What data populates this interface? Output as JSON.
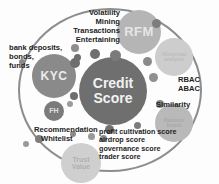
{
  "diagram": {
    "center_node": {
      "label_line1": "Credit",
      "label_line2": "Score"
    },
    "nodes": [
      {
        "id": "rfm",
        "label": "RFM"
      },
      {
        "id": "kyc",
        "label": "KYC"
      },
      {
        "id": "fh",
        "label": "FH"
      },
      {
        "id": "trust",
        "label_line1": "Trust",
        "label_line2": "Value"
      },
      {
        "id": "abnormal",
        "label_line1": "Abnormal",
        "label_line2": "analysis"
      },
      {
        "id": "random",
        "label_line1": "Random",
        "label_line2": "forest"
      }
    ],
    "labels": {
      "top_group": [
        "Volatility",
        "Mining",
        "Transactions",
        "Entertaining"
      ],
      "left_group": [
        "bank deposits,",
        "bonds,",
        "funds"
      ],
      "right_access": [
        "RBAC",
        "ABAC"
      ],
      "similarity": "Similarity",
      "bottom_left_group": [
        "Recommendation",
        "Whitelist"
      ],
      "bottom_right_group": [
        "profit cultivation score",
        "airdrop score",
        "governance score",
        "trader score"
      ]
    },
    "colors": {
      "ring_stroke": "#8d8d8d",
      "center_fill": "#6f6f6f",
      "rfm_fill": "#b5b5b5",
      "kyc_fill": "#8a8a8a",
      "trust_fill": "#cfcfcf",
      "abnormal_fill": "#cdcdcd",
      "random_fill": "#b9b9b9",
      "text": "#1d1d1d",
      "background": "#fdfdfd"
    }
  }
}
